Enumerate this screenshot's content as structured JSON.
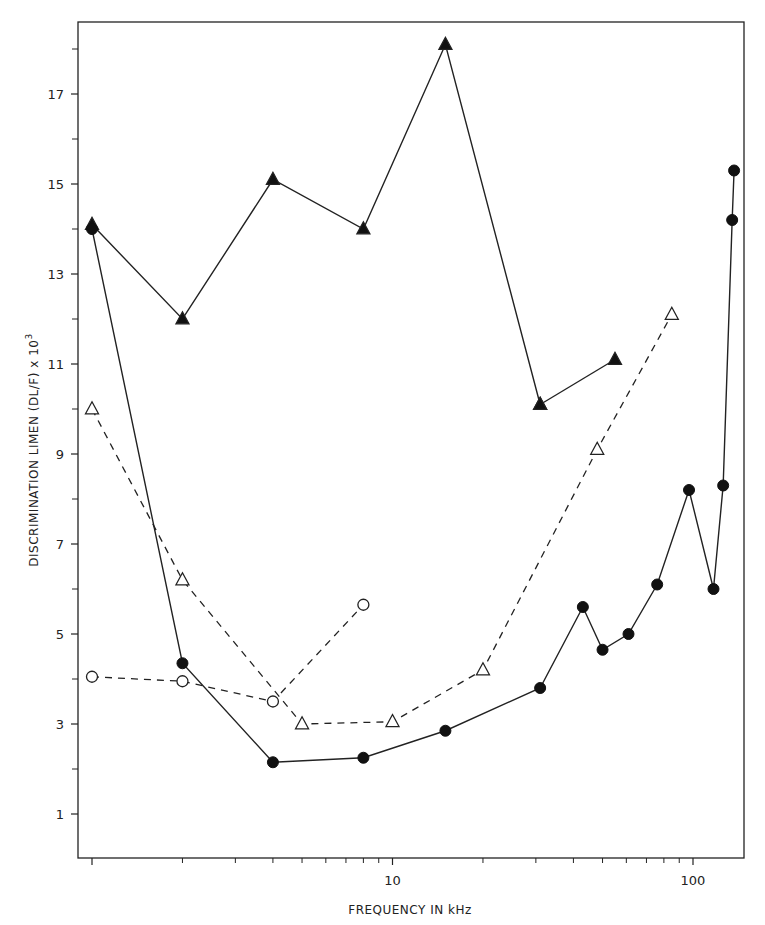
{
  "chart_data": {
    "type": "line",
    "title": "",
    "xlabel": "FREQUENCY IN kHz",
    "ylabel": "DISCRIMINATION LIMEN (DL/F) x 10",
    "ylabel_superscript": "3",
    "xscale": "log",
    "xlim": [
      0.95,
      150
    ],
    "ylim": [
      0.1,
      18.6
    ],
    "x_ticks_major": [
      1,
      10,
      100
    ],
    "x_tick_labels": [
      "",
      "10",
      "100"
    ],
    "x_ticks_minor": [
      2,
      3,
      4,
      5,
      6,
      7,
      8,
      9,
      20,
      30,
      40,
      50,
      60,
      70,
      80,
      90
    ],
    "y_ticks_major": [
      1,
      3,
      5,
      7,
      9,
      11,
      13,
      15,
      17
    ],
    "y_tick_labels": [
      "1",
      "3",
      "5",
      "7",
      "9",
      "11",
      "13",
      "15",
      "17"
    ],
    "y_ticks_minor": [
      2,
      4,
      6,
      8,
      10,
      12,
      14,
      16,
      18
    ],
    "grid": false,
    "legend": "none",
    "series": [
      {
        "name": "filled-triangles",
        "marker": "triangle-filled",
        "line": "solid",
        "x": [
          1,
          2,
          4,
          8,
          15,
          31
        ],
        "y": [
          14.1,
          12.0,
          15.1,
          14.0,
          18.1,
          10.1
        ],
        "segment_break_after": null
      },
      {
        "name": "filled-triangles-tail",
        "marker": "triangle-filled",
        "line": "solid",
        "x": [
          31,
          55
        ],
        "y": [
          10.1,
          11.1
        ]
      },
      {
        "name": "filled-circles",
        "marker": "circle-filled",
        "line": "solid",
        "x": [
          1,
          2,
          4,
          8,
          15,
          31,
          43,
          50,
          61,
          76,
          97,
          117,
          126,
          135,
          137
        ],
        "y": [
          14.0,
          4.35,
          2.15,
          2.25,
          2.85,
          3.8,
          5.6,
          4.65,
          5.0,
          6.1,
          8.2,
          6.0,
          8.3,
          14.2,
          15.3
        ]
      },
      {
        "name": "open-triangles",
        "marker": "triangle-open",
        "line": "dashed",
        "x": [
          1,
          2,
          5,
          10,
          20,
          48,
          85
        ],
        "y": [
          10.0,
          6.2,
          3.0,
          3.05,
          4.2,
          9.1,
          12.1
        ]
      },
      {
        "name": "open-circles",
        "marker": "circle-open",
        "line": "dashed",
        "x": [
          1,
          2,
          4,
          8
        ],
        "y": [
          4.05,
          3.95,
          3.5,
          5.65
        ]
      }
    ]
  }
}
